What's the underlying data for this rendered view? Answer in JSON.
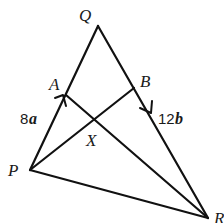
{
  "diagram": {
    "title": "",
    "points": {
      "Q": {
        "label": "Q",
        "x": 98,
        "y": 26
      },
      "P": {
        "label": "P",
        "x": 30,
        "y": 170
      },
      "R": {
        "label": "R",
        "x": 208,
        "y": 218
      },
      "A": {
        "label": "A",
        "x": 66,
        "y": 95
      },
      "B": {
        "label": "B",
        "x": 134,
        "y": 88
      },
      "X": {
        "label": "X",
        "x": 95,
        "y": 117
      }
    },
    "segments": [
      {
        "from": "P",
        "to": "Q"
      },
      {
        "from": "Q",
        "to": "R"
      },
      {
        "from": "P",
        "to": "R"
      },
      {
        "from": "P",
        "to": "B"
      },
      {
        "from": "A",
        "to": "R"
      }
    ],
    "vectors": {
      "PA": {
        "coefficient": "8",
        "symbol": "a"
      },
      "BR": {
        "coefficient": "12",
        "symbol": "b"
      }
    },
    "colors": {
      "line": "#111111",
      "background": "#ffffff"
    }
  }
}
